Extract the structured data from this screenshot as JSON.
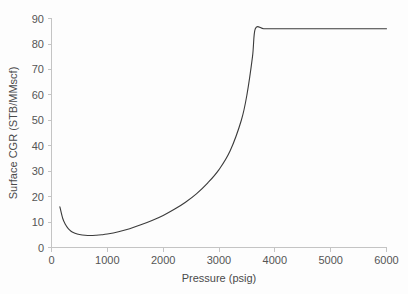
{
  "chart_data": {
    "type": "line",
    "title": "",
    "xlabel": "Pressure (psig)",
    "ylabel": "Surface CGR (STB/MMscf)",
    "xlim": [
      0,
      6000
    ],
    "ylim": [
      0,
      90
    ],
    "xticks": [
      0,
      1000,
      2000,
      3000,
      4000,
      5000,
      6000
    ],
    "yticks": [
      0,
      10,
      20,
      30,
      40,
      50,
      60,
      70,
      80,
      90
    ],
    "xtick_labels": [
      "0",
      "1000",
      "2000",
      "3000",
      "4000",
      "5000",
      "6000"
    ],
    "ytick_labels": [
      "0",
      "10",
      "20",
      "30",
      "40",
      "50",
      "60",
      "70",
      "80",
      "90"
    ],
    "grid": false,
    "legend": "none",
    "series": [
      {
        "name": "Surface CGR",
        "color": "#3b3b3b",
        "x": [
          150,
          200,
          250,
          300,
          350,
          400,
          450,
          500,
          600,
          700,
          800,
          900,
          1000,
          1200,
          1400,
          1600,
          1800,
          2000,
          2200,
          2400,
          2600,
          2800,
          3000,
          3200,
          3400,
          3500,
          3600,
          3650,
          3800,
          4000,
          4500,
          5000,
          5500,
          6000
        ],
        "y": [
          16.0,
          11.5,
          9.0,
          7.4,
          6.4,
          5.8,
          5.4,
          5.1,
          4.8,
          4.7,
          4.8,
          5.0,
          5.3,
          6.2,
          7.4,
          8.9,
          10.6,
          12.6,
          15.0,
          17.8,
          21.2,
          25.4,
          30.6,
          38.0,
          50.0,
          60.0,
          75.0,
          86.0,
          86.0,
          86.0,
          86.0,
          86.0,
          86.0,
          86.0
        ]
      }
    ],
    "annotations": []
  },
  "axes": {
    "x_axis_name": "pressure-axis",
    "y_axis_name": "surface-cgr-axis"
  }
}
